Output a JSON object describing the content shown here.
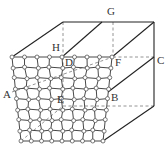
{
  "diagram": {
    "type": "3d-geometry-box-with-mesh-face",
    "labels": {
      "A": "A",
      "B": "B",
      "C": "C",
      "D": "D",
      "E": "E",
      "F": "F",
      "G": "G",
      "H": "H"
    },
    "front_face_grid": {
      "rows": 8,
      "columns": 8,
      "top_left": [
        12,
        57
      ],
      "top_right": [
        112,
        57
      ],
      "bottom_left": [
        21,
        141
      ],
      "bottom_right": [
        103,
        141
      ]
    },
    "colors": {
      "solid_line": "#222222",
      "dashed_line": "#888888",
      "node_fill": "#ffffff",
      "label": "#333333"
    }
  }
}
